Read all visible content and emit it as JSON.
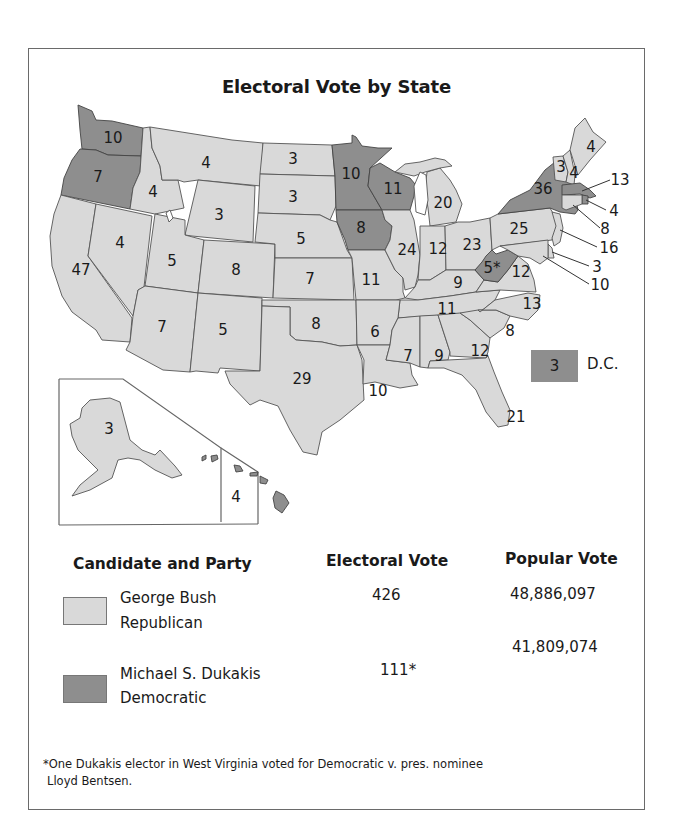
{
  "title": "Electoral Vote by State",
  "colors": {
    "republican": "#d9d9d9",
    "democratic": "#8e8e8e"
  },
  "states": {
    "WA": {
      "ev": "10",
      "party": "dem"
    },
    "OR": {
      "ev": "7",
      "party": "dem"
    },
    "CA": {
      "ev": "47",
      "party": "rep"
    },
    "ID": {
      "ev": "4",
      "party": "rep"
    },
    "NV": {
      "ev": "4",
      "party": "rep"
    },
    "MT": {
      "ev": "4",
      "party": "rep"
    },
    "WY": {
      "ev": "3",
      "party": "rep"
    },
    "UT": {
      "ev": "5",
      "party": "rep"
    },
    "CO": {
      "ev": "8",
      "party": "rep"
    },
    "AZ": {
      "ev": "7",
      "party": "rep"
    },
    "NM": {
      "ev": "5",
      "party": "rep"
    },
    "ND": {
      "ev": "3",
      "party": "rep"
    },
    "SD": {
      "ev": "3",
      "party": "rep"
    },
    "NE": {
      "ev": "5",
      "party": "rep"
    },
    "KS": {
      "ev": "7",
      "party": "rep"
    },
    "OK": {
      "ev": "8",
      "party": "rep"
    },
    "TX": {
      "ev": "29",
      "party": "rep"
    },
    "MN": {
      "ev": "10",
      "party": "dem"
    },
    "IA": {
      "ev": "8",
      "party": "dem"
    },
    "MO": {
      "ev": "11",
      "party": "rep"
    },
    "AR": {
      "ev": "6",
      "party": "rep"
    },
    "LA": {
      "ev": "10",
      "party": "rep"
    },
    "WI": {
      "ev": "11",
      "party": "dem"
    },
    "IL": {
      "ev": "24",
      "party": "rep"
    },
    "MI": {
      "ev": "20",
      "party": "rep"
    },
    "IN": {
      "ev": "12",
      "party": "rep"
    },
    "OH": {
      "ev": "23",
      "party": "rep"
    },
    "KY": {
      "ev": "9",
      "party": "rep"
    },
    "TN": {
      "ev": "11",
      "party": "rep"
    },
    "MS": {
      "ev": "7",
      "party": "rep"
    },
    "AL": {
      "ev": "9",
      "party": "rep"
    },
    "GA": {
      "ev": "12",
      "party": "rep"
    },
    "FL": {
      "ev": "21",
      "party": "rep"
    },
    "SC": {
      "ev": "8",
      "party": "rep"
    },
    "NC": {
      "ev": "13",
      "party": "rep"
    },
    "VA": {
      "ev": "12",
      "party": "rep"
    },
    "WV": {
      "ev": "5*",
      "party": "dem"
    },
    "PA": {
      "ev": "25",
      "party": "rep"
    },
    "NY": {
      "ev": "36",
      "party": "dem"
    },
    "VT": {
      "ev": "3",
      "party": "rep"
    },
    "NH": {
      "ev": "4",
      "party": "rep"
    },
    "ME": {
      "ev": "4",
      "party": "rep"
    },
    "MA": {
      "ev": "13",
      "party": "dem"
    },
    "RI": {
      "ev": "4",
      "party": "dem"
    },
    "CT": {
      "ev": "8",
      "party": "rep"
    },
    "NJ": {
      "ev": "16",
      "party": "rep"
    },
    "DE": {
      "ev": "3",
      "party": "rep"
    },
    "MD": {
      "ev": "10",
      "party": "rep"
    },
    "AK": {
      "ev": "3",
      "party": "rep"
    },
    "HI": {
      "ev": "4",
      "party": "dem"
    }
  },
  "dc": {
    "ev": "3",
    "label": "D.C.",
    "party": "dem"
  },
  "legend": {
    "headers": {
      "candidate": "Candidate and Party",
      "electoral": "Electoral Vote",
      "popular": "Popular Vote"
    },
    "rows": [
      {
        "name": "George Bush",
        "party": "Republican",
        "electoral": "426",
        "popular": "48,886,097"
      },
      {
        "name": "Michael S. Dukakis",
        "party": "Democratic",
        "electoral": "111*",
        "popular": "41,809,074"
      }
    ]
  },
  "footnote": {
    "line1": "*One Dukakis elector in West Virginia voted for Democratic v. pres. nominee",
    "line2": "Lloyd Bentsen."
  }
}
